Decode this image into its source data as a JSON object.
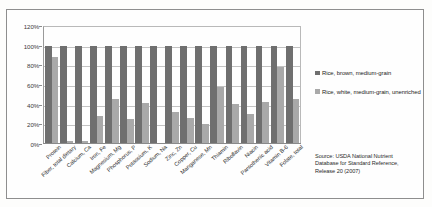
{
  "chart_data": {
    "type": "bar",
    "title": "",
    "xlabel": "",
    "ylabel": "",
    "ylim": [
      0,
      120
    ],
    "yticks": [
      "0%",
      "20%",
      "40%",
      "60%",
      "80%",
      "100%",
      "120%"
    ],
    "ytick_values": [
      0,
      20,
      40,
      60,
      80,
      100,
      120
    ],
    "grid": true,
    "legend_position": "right",
    "categories": [
      "Protein",
      "Fiber, total dietary",
      "Calcium, Ca",
      "Iron, Fe",
      "Magnesium, Mg",
      "Phosphorus, P",
      "Potassium, K",
      "Sodium, Na",
      "Zinc, Zn",
      "Copper, Cu",
      "Manganese, Mn",
      "Thiamin",
      "Riboflavin",
      "Niacin",
      "Pantothenic acid",
      "Vitamin B-6",
      "Folate, total"
    ],
    "series": [
      {
        "name": "Rice, brown, medium-grain",
        "color": "#6f6f6f",
        "values": [
          100,
          100,
          100,
          100,
          100,
          100,
          100,
          100,
          100,
          100,
          100,
          100,
          100,
          100,
          100,
          100,
          100
        ]
      },
      {
        "name": "Rice, white, medium-grain, unenriched",
        "color": "#a9a9a9",
        "values": [
          88,
          2,
          2,
          28,
          45,
          25,
          41,
          0,
          32,
          26,
          20,
          57,
          40,
          30,
          42,
          78,
          45
        ]
      }
    ]
  },
  "legend": {
    "items": [
      {
        "label": "Rice, brown, medium-grain"
      },
      {
        "label": "Rice, white, medium-grain, unenriched"
      }
    ]
  },
  "source": {
    "lines": [
      "Source: USDA National Nutrient",
      "Database for Standard Reference,",
      "Release 20 (2007)"
    ]
  }
}
